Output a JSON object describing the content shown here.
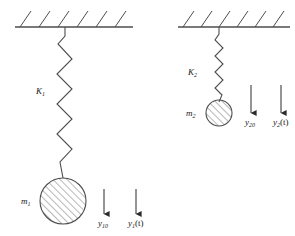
{
  "figure": {
    "stroke_color": "#4d4d4d",
    "text_color": "#1a1a1a",
    "background": "#ffffff"
  },
  "systems": [
    {
      "id": "left-system",
      "spring_label": "K",
      "spring_label_sub": "1",
      "mass_label": "m",
      "mass_label_sub": "1",
      "arrows": [
        {
          "id": "y10",
          "base": "y",
          "sub": "10",
          "suffix": ""
        },
        {
          "id": "y1t",
          "base": "y",
          "sub": "1",
          "suffix": "(t)"
        }
      ]
    },
    {
      "id": "right-system",
      "spring_label": "K",
      "spring_label_sub": "2",
      "mass_label": "m",
      "mass_label_sub": "2",
      "arrows": [
        {
          "id": "y20",
          "base": "y",
          "sub": "20",
          "suffix": ""
        },
        {
          "id": "y2t",
          "base": "y",
          "sub": "2",
          "suffix": "(t)"
        }
      ]
    }
  ],
  "labels": {
    "k1": "K",
    "k1_sub": "1",
    "k2": "K",
    "k2_sub": "2",
    "m1": "m",
    "m1_sub": "1",
    "m2": "m",
    "m2_sub": "2",
    "y10": "y",
    "y10_sub": "10",
    "y1t": "y",
    "y1t_sub": "1",
    "y1t_suffix": "(t)",
    "y20": "y",
    "y20_sub": "20",
    "y2t": "y",
    "y2t_sub": "2",
    "y2t_suffix": "(t)"
  }
}
